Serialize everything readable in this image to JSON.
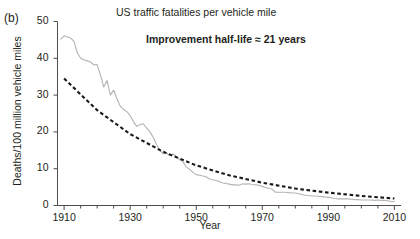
{
  "figure": {
    "panel_label": "(b)",
    "title": "US traffic fatalities per vehicle mile",
    "annotation": "Improvement half-life ≈ 21 years",
    "xlabel": "Year",
    "ylabel": "Deaths/100 million vehicle miles"
  },
  "colors": {
    "data_line": "#b3b3b3",
    "fit_line": "#1a1a1a",
    "axis": "#4d4d4d",
    "text": "#231f20",
    "background": "#ffffff"
  },
  "chart_data": {
    "type": "line",
    "title": "US traffic fatalities per vehicle mile",
    "xlabel": "Year",
    "ylabel": "Deaths/100 million vehicle miles",
    "xlim": [
      1908,
      2012
    ],
    "ylim": [
      0,
      50
    ],
    "yticks": [
      0,
      10,
      20,
      30,
      40,
      50
    ],
    "ytick_labels": [
      "0",
      "10",
      "20",
      "30",
      "40",
      "50"
    ],
    "xticks": [
      1910,
      1930,
      1950,
      1970,
      1990,
      2010
    ],
    "xtick_labels": [
      "1910",
      "1930",
      "1950",
      "1970",
      "1990",
      "2010"
    ],
    "minor_tick_interval": 5,
    "grid": false,
    "legend": "none",
    "annotations": [
      {
        "text": "Improvement half-life ≈ 21 years",
        "x": 1945,
        "y": 43
      }
    ],
    "series": [
      {
        "name": "US traffic fatalities per 100 million vehicle miles",
        "style": "solid",
        "color": "#b3b3b3",
        "x": [
          1909,
          1910,
          1911,
          1912,
          1913,
          1914,
          1915,
          1916,
          1917,
          1918,
          1919,
          1920,
          1921,
          1922,
          1923,
          1924,
          1925,
          1926,
          1927,
          1928,
          1929,
          1930,
          1931,
          1932,
          1933,
          1934,
          1935,
          1936,
          1937,
          1938,
          1939,
          1940,
          1941,
          1942,
          1943,
          1944,
          1945,
          1946,
          1947,
          1948,
          1949,
          1950,
          1951,
          1952,
          1953,
          1954,
          1955,
          1956,
          1957,
          1958,
          1959,
          1960,
          1961,
          1962,
          1963,
          1964,
          1965,
          1966,
          1967,
          1968,
          1969,
          1970,
          1971,
          1972,
          1973,
          1974,
          1975,
          1976,
          1977,
          1978,
          1979,
          1980,
          1981,
          1982,
          1983,
          1984,
          1985,
          1986,
          1987,
          1988,
          1989,
          1990,
          1991,
          1992,
          1993,
          1994,
          1995,
          1996,
          1997,
          1998,
          1999,
          2000,
          2001,
          2002,
          2003,
          2004,
          2005,
          2006,
          2007,
          2008,
          2009,
          2010
        ],
        "y": [
          45.2,
          46.1,
          45.8,
          45.5,
          44.6,
          41.5,
          40.0,
          39.6,
          39.3,
          39.0,
          38.2,
          38.3,
          35.5,
          32.2,
          34.0,
          30.0,
          31.4,
          29.0,
          27.0,
          26.1,
          25.5,
          24.4,
          22.8,
          21.5,
          22.0,
          22.2,
          21.0,
          20.0,
          18.5,
          16.5,
          15.0,
          14.0,
          14.2,
          13.6,
          14.0,
          13.2,
          12.4,
          11.8,
          10.5,
          9.8,
          9.0,
          8.4,
          8.2,
          8.0,
          7.8,
          7.2,
          7.0,
          6.8,
          6.5,
          6.1,
          6.0,
          5.8,
          5.6,
          5.6,
          5.5,
          5.9,
          5.8,
          5.9,
          5.7,
          5.6,
          5.5,
          5.2,
          4.9,
          4.6,
          4.4,
          3.6,
          3.6,
          3.6,
          3.6,
          3.5,
          3.4,
          3.4,
          3.2,
          3.0,
          2.8,
          2.7,
          2.6,
          2.6,
          2.5,
          2.4,
          2.3,
          2.2,
          2.1,
          1.9,
          1.8,
          1.8,
          1.8,
          1.8,
          1.7,
          1.6,
          1.6,
          1.5,
          1.5,
          1.5,
          1.5,
          1.4,
          1.5,
          1.4,
          1.4,
          1.3,
          1.1,
          1.1
        ]
      },
      {
        "name": "Exponential fit (half-life 21 years)",
        "style": "dashed",
        "color": "#1a1a1a",
        "x": [
          1910,
          1920,
          1930,
          1940,
          1950,
          1960,
          1970,
          1980,
          1990,
          2000,
          2010
        ],
        "y": [
          34.5,
          25.9,
          19.4,
          14.6,
          10.9,
          8.2,
          6.2,
          4.6,
          3.5,
          2.6,
          1.9
        ]
      }
    ]
  }
}
